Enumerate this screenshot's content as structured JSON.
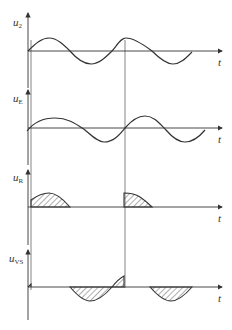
{
  "figure": {
    "type": "waveform-timing-diagram",
    "panels": [
      {
        "id": "u2",
        "label_main": "u",
        "label_sub": "2",
        "axis_label": "t",
        "description": "supply voltage sine wave"
      },
      {
        "id": "uE",
        "label_main": "u",
        "label_sub": "E",
        "axis_label": "t",
        "description": "lagging sine wave"
      },
      {
        "id": "uR",
        "label_main": "u",
        "label_sub": "R",
        "axis_label": "t",
        "description": "hatched positive half-wave segments after firing"
      },
      {
        "id": "uVS",
        "label_main": "u",
        "label_sub": "VS",
        "axis_label": "t",
        "description": "hatched thyristor voltage segments"
      }
    ]
  },
  "colors": {
    "line": "#333333",
    "grid": "#666666",
    "background": "#ffffff"
  }
}
